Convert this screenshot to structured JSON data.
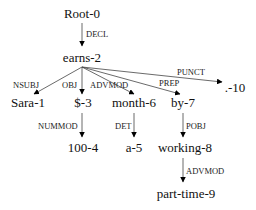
{
  "diagram": {
    "type": "dependency-parse-tree",
    "nodes": [
      {
        "id": "root",
        "label": "Root-0",
        "x": 82,
        "y": 18
      },
      {
        "id": "earns",
        "label": "earns-2",
        "x": 82,
        "y": 62
      },
      {
        "id": "sara",
        "label": "Sara-1",
        "x": 28,
        "y": 107
      },
      {
        "id": "dollar",
        "label": "$-3",
        "x": 82,
        "y": 107
      },
      {
        "id": "month",
        "label": "month-6",
        "x": 134,
        "y": 107
      },
      {
        "id": "by",
        "label": "by-7",
        "x": 182,
        "y": 107
      },
      {
        "id": "punct",
        "label": ".-10",
        "x": 232,
        "y": 92
      },
      {
        "id": "hundred",
        "label": "100-4",
        "x": 82,
        "y": 152
      },
      {
        "id": "a",
        "label": "a-5",
        "x": 134,
        "y": 152
      },
      {
        "id": "working",
        "label": "working-8",
        "x": 183,
        "y": 152
      },
      {
        "id": "parttime",
        "label": "part-time-9",
        "x": 183,
        "y": 198
      }
    ],
    "edges": [
      {
        "from": "root",
        "to": "earns",
        "label": "DECL"
      },
      {
        "from": "earns",
        "to": "sara",
        "label": "NSUBJ"
      },
      {
        "from": "earns",
        "to": "dollar",
        "label": "OBJ"
      },
      {
        "from": "earns",
        "to": "month",
        "label": "ADVMOD"
      },
      {
        "from": "earns",
        "to": "by",
        "label": "PREP"
      },
      {
        "from": "earns",
        "to": "punct",
        "label": "PUNCT"
      },
      {
        "from": "dollar",
        "to": "hundred",
        "label": "NUMMOD"
      },
      {
        "from": "month",
        "to": "a",
        "label": "DET"
      },
      {
        "from": "by",
        "to": "working",
        "label": "POBJ"
      },
      {
        "from": "working",
        "to": "parttime",
        "label": "ADVMOD"
      }
    ]
  },
  "labels": {
    "root": "Root-0",
    "earns": "earns-2",
    "sara": "Sara-1",
    "dollar": "$-3",
    "month": "month-6",
    "by": "by-7",
    "punct": ".-10",
    "hundred": "100-4",
    "a": "a-5",
    "working": "working-8",
    "parttime": "part-time-9",
    "rel_decl": "DECL",
    "rel_nsubj": "NSUBJ",
    "rel_obj": "OBJ",
    "rel_advmod_month": "ADVMOD",
    "rel_prep": "PREP",
    "rel_punct": "PUNCT",
    "rel_nummod": "NUMMOD",
    "rel_det": "DET",
    "rel_pobj": "POBJ",
    "rel_advmod_parttime": "ADVMOD"
  },
  "colors": {
    "background": "#ffffff",
    "text": "#111111",
    "edge": "#444444",
    "arrowhead": "#000000"
  }
}
